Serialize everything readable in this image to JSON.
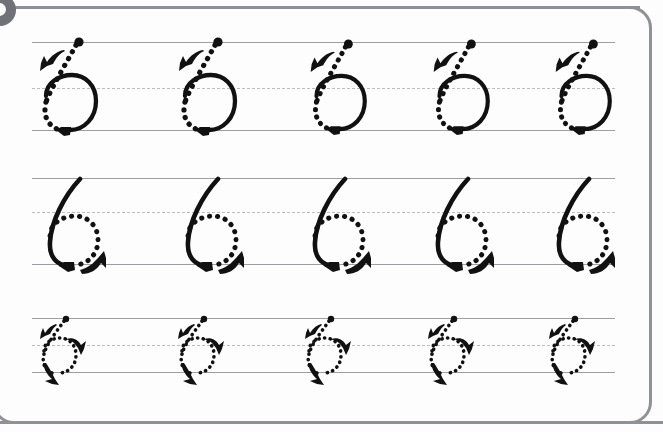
{
  "worksheet": {
    "title": "Number 6 Tracing Practice",
    "glyph_character": "6",
    "corner_badge": {
      "icon": "numbered-step-badge",
      "label": ""
    },
    "colors": {
      "page_background": "#fdfdfd",
      "frame_border": "#8f9194",
      "solid_guide_line": "#9b9ea2",
      "dashed_guide_line": "#b9bcc0",
      "stroke_ink": "#111111",
      "badge_fill": "#6f7276"
    },
    "rows": [
      {
        "name": "row-1-top-hook-dotted",
        "label": "Row 1",
        "top_line_y": 42,
        "mid_line_y": 88,
        "base_line_y": 130,
        "glyph_height_px": 88,
        "stroke_style": "dotted-diagonal-with-solid-loop",
        "description": "Dotted descending curve from top line to baseline, solid circular loop sitting between midline and baseline",
        "items": [
          {
            "index": 1,
            "x": 36,
            "start_dot": true,
            "arrow_count": 2
          },
          {
            "index": 2,
            "x": 175,
            "start_dot": true,
            "arrow_count": 2
          },
          {
            "index": 3,
            "x": 307,
            "start_dot": true,
            "arrow_count": 2
          },
          {
            "index": 4,
            "x": 430,
            "start_dot": true,
            "arrow_count": 2
          },
          {
            "index": 5,
            "x": 552,
            "start_dot": true,
            "arrow_count": 2
          }
        ]
      },
      {
        "name": "row-2-solid-stem-dotted-loop",
        "label": "Row 2",
        "top_line_y": 178,
        "mid_line_y": 212,
        "base_line_y": 264,
        "glyph_height_px": 86,
        "stroke_style": "solid-stem-with-dotted-loop",
        "description": "Solid descending stem curve from top line to baseline, dotted circular loop with solid arrow at lower right",
        "items": [
          {
            "index": 1,
            "x": 40,
            "start_dot": false,
            "arrow_count": 2
          },
          {
            "index": 2,
            "x": 178,
            "start_dot": false,
            "arrow_count": 2
          },
          {
            "index": 3,
            "x": 305,
            "start_dot": false,
            "arrow_count": 2
          },
          {
            "index": 4,
            "x": 428,
            "start_dot": false,
            "arrow_count": 2
          },
          {
            "index": 5,
            "x": 549,
            "start_dot": false,
            "arrow_count": 2
          }
        ]
      },
      {
        "name": "row-3-all-dotted-small",
        "label": "Row 3",
        "top_line_y": 318,
        "mid_line_y": 345,
        "base_line_y": 372,
        "glyph_height_px": 54,
        "stroke_style": "all-dotted",
        "description": "Fully dotted small numeral six with start dot at top and two solid directional arrows",
        "items": [
          {
            "index": 1,
            "x": 38,
            "start_dot": true,
            "arrow_count": 2
          },
          {
            "index": 2,
            "x": 176,
            "start_dot": true,
            "arrow_count": 2
          },
          {
            "index": 3,
            "x": 303,
            "start_dot": true,
            "arrow_count": 2
          },
          {
            "index": 4,
            "x": 426,
            "start_dot": true,
            "arrow_count": 2
          },
          {
            "index": 5,
            "x": 547,
            "start_dot": true,
            "arrow_count": 2
          }
        ]
      }
    ]
  }
}
